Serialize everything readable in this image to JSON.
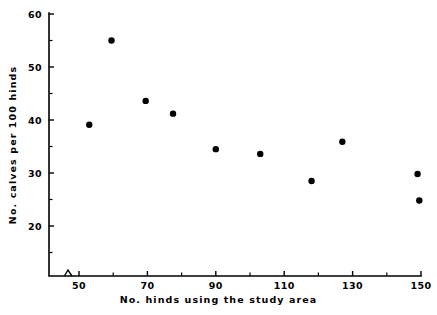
{
  "chart_data": {
    "type": "scatter",
    "title": "",
    "xlabel": "No. hinds using the study area",
    "ylabel": "No. calves per 100 hinds",
    "xlim": [
      46,
      152
    ],
    "ylim": [
      13,
      60
    ],
    "grid": false,
    "legend": null,
    "axis_break": {
      "axis": "x",
      "position": 47.5,
      "symbol": "zigzag"
    },
    "xticks_major": [
      50,
      70,
      90,
      110,
      130,
      150
    ],
    "xticks_major_labels": [
      "50",
      "70",
      "90",
      "110",
      "130",
      "150"
    ],
    "xticks_minor": [
      60,
      80,
      100,
      120,
      140
    ],
    "yticks_major": [
      20,
      30,
      40,
      50,
      60
    ],
    "yticks_major_labels": [
      "20",
      "30",
      "40",
      "50",
      "60"
    ],
    "yticks_minor": [
      15,
      25,
      35,
      45,
      55
    ],
    "marker": "filled-circle",
    "marker_color": "#000000",
    "marker_size_px": 3.2,
    "points": [
      {
        "x": 53,
        "y": 39.1
      },
      {
        "x": 59.5,
        "y": 55.0
      },
      {
        "x": 69.5,
        "y": 43.6
      },
      {
        "x": 77.5,
        "y": 41.2
      },
      {
        "x": 90,
        "y": 34.5
      },
      {
        "x": 103,
        "y": 33.6
      },
      {
        "x": 118,
        "y": 28.5
      },
      {
        "x": 127,
        "y": 35.9
      },
      {
        "x": 149,
        "y": 29.8
      },
      {
        "x": 149.5,
        "y": 24.8
      }
    ]
  },
  "axes": {
    "x_title": "No. hinds using the study area",
    "y_title": "No. calves per 100 hinds"
  },
  "colors": {
    "background": "#ffffff",
    "foreground": "#000000",
    "marker": "#000000"
  }
}
